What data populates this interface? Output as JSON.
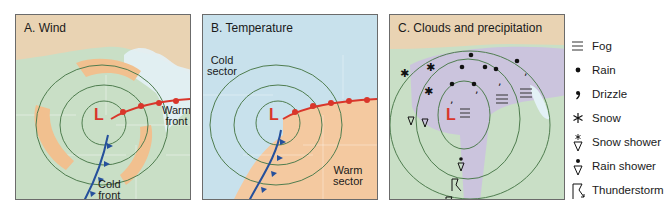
{
  "panels": [
    {
      "id": "A",
      "title": "A. Wind",
      "labels": {
        "warm_front": "Warm\nfront",
        "cold_front": "Cold\nfront",
        "low": "L"
      }
    },
    {
      "id": "B",
      "title": "B. Temperature",
      "labels": {
        "cold_sector": "Cold\nsector",
        "warm_sector": "Warm\nsector",
        "low": "L"
      }
    },
    {
      "id": "C",
      "title": "C. Clouds and precipitation",
      "labels": {
        "low": "L"
      }
    }
  ],
  "legend": {
    "items": [
      {
        "icon": "fog-icon",
        "label": "Fog"
      },
      {
        "icon": "rain-icon",
        "label": "Rain"
      },
      {
        "icon": "drizzle-icon",
        "label": "Drizzle"
      },
      {
        "icon": "snow-icon",
        "label": "Snow"
      },
      {
        "icon": "snow-shower-icon",
        "label": "Snow shower"
      },
      {
        "icon": "rain-shower-icon",
        "label": "Rain shower"
      },
      {
        "icon": "thunderstorm-icon",
        "label": "Thunderstorm"
      }
    ]
  },
  "colors": {
    "land_green": "#c9dfc6",
    "north_tan": "#e9d3b3",
    "wind_orange": "#f1c08f",
    "cold_blue": "#c8e1ec",
    "warm_orange": "#f4c9a0",
    "cloud_purple": "#cbc4dd",
    "isobar": "#4f7d4f",
    "warm_front": "#d9362b",
    "cold_front": "#25509c",
    "lake": "#e3f1f6"
  }
}
